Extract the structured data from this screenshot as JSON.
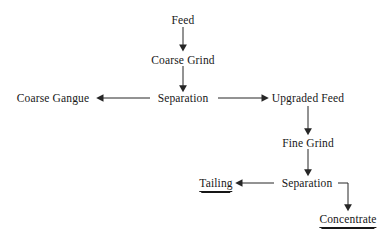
{
  "diagram": {
    "line_color": "#262626",
    "text_color": "#171717",
    "background": "#ffffff",
    "nodes": [
      {
        "id": "feed",
        "label": "Feed",
        "x": 183,
        "y": 14,
        "terminal": false
      },
      {
        "id": "coarse-grind",
        "label": "Coarse Grind",
        "x": 183,
        "y": 54,
        "terminal": false
      },
      {
        "id": "coarse-gangue",
        "label": "Coarse Gangue",
        "x": 53,
        "y": 92,
        "terminal": false
      },
      {
        "id": "separation-1",
        "label": "Separation",
        "x": 183,
        "y": 92,
        "terminal": false
      },
      {
        "id": "upgraded-feed",
        "label": "Upgraded Feed",
        "x": 308,
        "y": 92,
        "terminal": false
      },
      {
        "id": "fine-grind",
        "label": "Fine Grind",
        "x": 308,
        "y": 137,
        "terminal": false
      },
      {
        "id": "tailing",
        "label": "Tailing",
        "x": 216,
        "y": 177,
        "terminal": true
      },
      {
        "id": "separation-2",
        "label": "Separation",
        "x": 307,
        "y": 177,
        "terminal": false
      },
      {
        "id": "concentrate",
        "label": "Concentrate",
        "x": 348,
        "y": 213,
        "terminal": true
      }
    ],
    "edges": [
      {
        "id": "feed-to-coarse-grind",
        "from": "feed",
        "to": "coarse-grind",
        "kind": "vertical"
      },
      {
        "id": "coarse-grind-to-separation-1",
        "from": "coarse-grind",
        "to": "separation-1",
        "kind": "vertical"
      },
      {
        "id": "separation-1-to-coarse-gangue",
        "from": "separation-1",
        "to": "coarse-gangue",
        "kind": "horizontal-left"
      },
      {
        "id": "separation-1-to-upgraded-feed",
        "from": "separation-1",
        "to": "upgraded-feed",
        "kind": "horizontal-right"
      },
      {
        "id": "upgraded-feed-to-fine-grind",
        "from": "upgraded-feed",
        "to": "fine-grind",
        "kind": "vertical"
      },
      {
        "id": "fine-grind-to-separation-2",
        "from": "fine-grind",
        "to": "separation-2",
        "kind": "vertical"
      },
      {
        "id": "separation-2-to-tailing",
        "from": "separation-2",
        "to": "tailing",
        "kind": "horizontal-left"
      },
      {
        "id": "separation-2-to-concentrate",
        "from": "separation-2",
        "to": "concentrate",
        "kind": "elbow-right-down"
      }
    ]
  }
}
